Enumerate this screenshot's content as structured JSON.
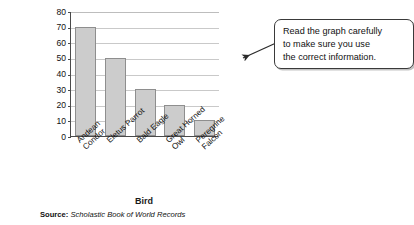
{
  "chart_data": {
    "type": "bar",
    "title": "",
    "categories": [
      "Andean Condor",
      "Eletus Parrot",
      "Bald Eagle",
      "Great Horned Owl",
      "Peregrine Falcon"
    ],
    "category_lines": [
      [
        "Andean",
        "Condor"
      ],
      [
        "Eletus Parrot"
      ],
      [
        "Bald Eagle"
      ],
      [
        "Great Horned",
        "Owl"
      ],
      [
        "Peregrine",
        "Falcon"
      ]
    ],
    "values": [
      70,
      50,
      30,
      20,
      10
    ],
    "xlabel": "Bird",
    "ylabel": "Maximum Life Span (yr)",
    "ylim": [
      0,
      80
    ],
    "ytick_step": 10,
    "yticks": [
      80,
      70,
      60,
      50,
      40,
      30,
      20,
      10,
      0
    ],
    "grid": true,
    "legend": "none",
    "bar_color": "#cccccc",
    "bar_border_color": "#8e8e8e",
    "axis_color": "#4a4a4a",
    "gridline_color": "#c9c9c9"
  },
  "source": {
    "label": "Source:",
    "text": "Scholastic Book of World Records"
  },
  "callout": {
    "text": "Read the graph carefully to make sure you use the correct information.",
    "line1": "Read the graph carefully",
    "line2": "to make sure you use",
    "line3": "the correct information.",
    "border_color": "#3a3a3a"
  }
}
